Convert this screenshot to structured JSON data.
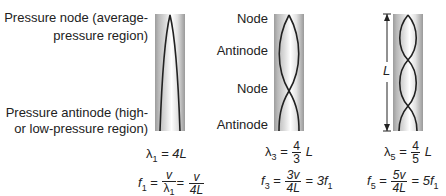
{
  "diagram": {
    "title": "",
    "harmonic1": {
      "labels": {
        "node_line1": "Pressure node (average-",
        "node_line2": "pressure region)",
        "antinode_line1": "Pressure antinode (high-",
        "antinode_line2": "or low-pressure region)"
      },
      "wavelength": {
        "lhs_symbol": "λ",
        "lhs_sub": "1",
        "eq": "=",
        "rhs": "4L"
      },
      "frequency": {
        "lhs_symbol": "f",
        "lhs_sub": "1",
        "eq1": "=",
        "frac1_num": "v",
        "frac1_den_symbol": "λ",
        "frac1_den_sub": "1",
        "eq2": "=",
        "frac2_num": "v",
        "frac2_den": "4L"
      }
    },
    "harmonic3": {
      "labels": [
        "Node",
        "Antinode",
        "Node",
        "Antinode"
      ],
      "wavelength": {
        "lhs_symbol": "λ",
        "lhs_sub": "3",
        "eq": "=",
        "frac_num": "4",
        "frac_den": "3",
        "rhs": "L"
      },
      "frequency": {
        "lhs_symbol": "f",
        "lhs_sub": "3",
        "eq1": "=",
        "frac_num": "3v",
        "frac_den": "4L",
        "eq2": "=",
        "rhs_coef": "3f",
        "rhs_sub": "1"
      }
    },
    "harmonic5": {
      "length_label": "L",
      "wavelength": {
        "lhs_symbol": "λ",
        "lhs_sub": "5",
        "eq": "=",
        "frac_num": "4",
        "frac_den": "5",
        "rhs": "L"
      },
      "frequency": {
        "lhs_symbol": "f",
        "lhs_sub": "5",
        "eq1": "=",
        "frac_num": "5v",
        "frac_den": "4L",
        "eq2": "=",
        "rhs_coef": "5f",
        "rhs_sub": "1"
      }
    },
    "colors": {
      "tube_edge": "#9c9c9c",
      "tube_center": "#ffffff",
      "wave": "#222222",
      "text": "#222222"
    }
  }
}
